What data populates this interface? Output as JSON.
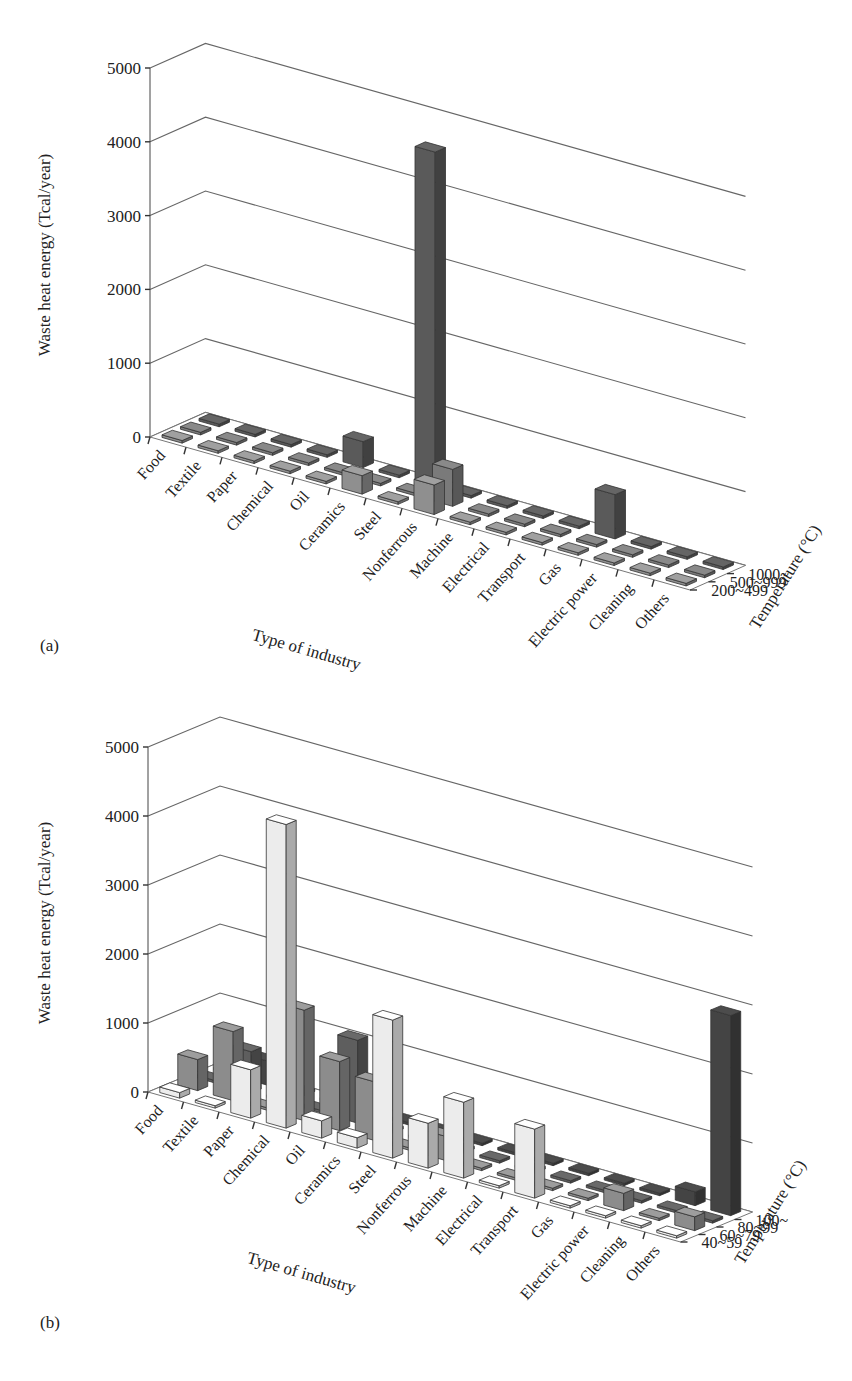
{
  "chart_data": [
    {
      "panel": "(a)",
      "type": "bar",
      "subtype": "3d-bar",
      "ylabel": "Waste heat energy (Tcal/year)",
      "xlabel": "Type of industry",
      "zlabel": "Temperature (°C)",
      "ylim": [
        0,
        5000
      ],
      "yticks": [
        0,
        1000,
        2000,
        3000,
        4000,
        5000
      ],
      "grid": true,
      "categories": [
        "Food",
        "Textile",
        "Paper",
        "Chemical",
        "Oil",
        "Ceramics",
        "Steel",
        "Nonferrous",
        "Machine",
        "Electrical",
        "Transport",
        "Gas",
        "Electric power",
        "Cleaning",
        "Others"
      ],
      "series": [
        {
          "name": "200~499",
          "color": "#8f8f8f",
          "values": [
            0,
            0,
            0,
            0,
            0,
            250,
            0,
            400,
            0,
            0,
            0,
            0,
            0,
            0,
            0
          ]
        },
        {
          "name": "500~999",
          "color": "#7a7a7a",
          "values": [
            0,
            0,
            0,
            0,
            0,
            0,
            0,
            500,
            0,
            0,
            0,
            0,
            0,
            0,
            0
          ]
        },
        {
          "name": "1000~",
          "color": "#5a5a5a",
          "values": [
            0,
            0,
            0,
            0,
            350,
            0,
            4550,
            0,
            0,
            0,
            0,
            600,
            0,
            0,
            0
          ]
        }
      ]
    },
    {
      "panel": "(b)",
      "type": "bar",
      "subtype": "3d-bar",
      "ylabel": "Waste heat energy (Tcal/year)",
      "xlabel": "Type of industry",
      "zlabel": "Temperature (°C)",
      "ylim": [
        0,
        5000
      ],
      "yticks": [
        0,
        1000,
        2000,
        3000,
        4000,
        5000
      ],
      "grid": true,
      "categories": [
        "Food",
        "Textile",
        "Paper",
        "Chemical",
        "Oil",
        "Ceramics",
        "Steel",
        "Nonferrous",
        "Machine",
        "Electrical",
        "Transport",
        "Gas",
        "Electric power",
        "Cleaning",
        "Others"
      ],
      "series": [
        {
          "name": "40~59",
          "color": "#ececec",
          "values": [
            80,
            0,
            700,
            4400,
            250,
            150,
            2000,
            650,
            1100,
            0,
            1000,
            0,
            0,
            0,
            0
          ]
        },
        {
          "name": "60~79",
          "color": "#8c8c8c",
          "values": [
            450,
            1000,
            0,
            1600,
            1000,
            850,
            0,
            350,
            0,
            0,
            0,
            0,
            250,
            0,
            200
          ]
        },
        {
          "name": "80~99",
          "color": "#5e5e5e",
          "values": [
            0,
            600,
            0,
            0,
            1200,
            0,
            0,
            0,
            0,
            0,
            0,
            0,
            0,
            0,
            0
          ]
        },
        {
          "name": "100~",
          "color": "#444444",
          "values": [
            0,
            350,
            0,
            0,
            0,
            0,
            0,
            0,
            0,
            0,
            0,
            0,
            0,
            200,
            2900
          ]
        }
      ]
    }
  ],
  "panels": [
    {
      "label": "(a)"
    },
    {
      "label": "(b)"
    }
  ]
}
